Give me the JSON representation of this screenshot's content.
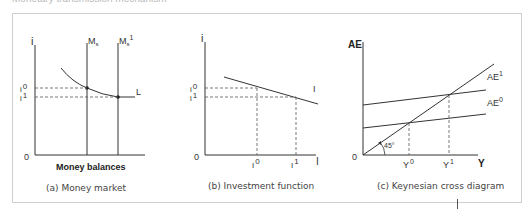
{
  "figure": {
    "top_caption": "Monetary transmission mechanism",
    "panels": [
      {
        "id": "a",
        "caption": "(a) Money market",
        "y_axis_label": "i",
        "x_axis_label": "Money balances",
        "origin_label": "0",
        "curves": [
          "Ms",
          "Ms1",
          "L"
        ],
        "labels": {
          "ms": "M",
          "ms_sub": "s",
          "ms1": "M",
          "ms1_sub": "s",
          "ms1_sup": "1",
          "l": "L",
          "i0_base": "i",
          "i0_sup": "0",
          "i1_base": "i",
          "i1_sup": "1"
        }
      },
      {
        "id": "b",
        "caption": "(b) Investment function",
        "y_axis_label": "i",
        "x_axis_label": "I",
        "origin_label": "0",
        "labels": {
          "curve": "I",
          "i0_base": "i",
          "i0_sup": "0",
          "i1_base": "i",
          "i1_sup": "1",
          "I0_base": "I",
          "I0_sup": "0",
          "I1_base": "I",
          "I1_sup": "1"
        }
      },
      {
        "id": "c",
        "caption": "(c) Keynesian cross diagram",
        "y_axis_label": "AE",
        "x_axis_label": "Y",
        "origin_label": "0",
        "labels": {
          "ae1": "AE",
          "ae1_sup": "1",
          "ae0": "AE",
          "ae0_sup": "0",
          "angle": "45°",
          "y0": "Y",
          "y0_sup": "0",
          "y1": "Y",
          "y1_sup": "1"
        }
      }
    ]
  },
  "colors": {
    "line": "#333333",
    "dashed": "#555555",
    "frame": "#cfcfcf"
  }
}
